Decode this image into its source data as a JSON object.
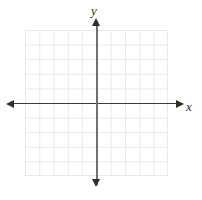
{
  "figure": {
    "kind": "cartesian-coordinate-plane",
    "width": 202,
    "height": 200,
    "background_color": "#ffffff"
  },
  "axes": {
    "x": {
      "label": "x",
      "color": "#2f2f2f",
      "arrow_left": "◀",
      "arrow_right": "▶"
    },
    "y": {
      "label": "y",
      "color": "#6f6f74",
      "arrow_up": "▲",
      "arrow_down": "▼"
    },
    "origin_label": ""
  },
  "grid": {
    "line_color": "#e9e9ec",
    "columns": 10,
    "rows": 10,
    "cell_width": 14.3,
    "cell_height": 14.6
  },
  "chart_data": {
    "type": "scatter",
    "title": "",
    "subtitle": "",
    "xlabel": "x",
    "ylabel": "y",
    "xlim": [
      -5,
      5
    ],
    "ylim": [
      -5,
      5
    ],
    "xticks": [
      -5,
      -4,
      -3,
      -2,
      -1,
      0,
      1,
      2,
      3,
      4,
      5
    ],
    "yticks": [
      -5,
      -4,
      -3,
      -2,
      -1,
      0,
      1,
      2,
      3,
      4,
      5
    ],
    "xtick_labels": [],
    "ytick_labels": [],
    "grid": true,
    "legend": null,
    "legend_position": "none",
    "annotations": [],
    "series": [
      {
        "name": "",
        "x": [],
        "y": []
      }
    ]
  }
}
